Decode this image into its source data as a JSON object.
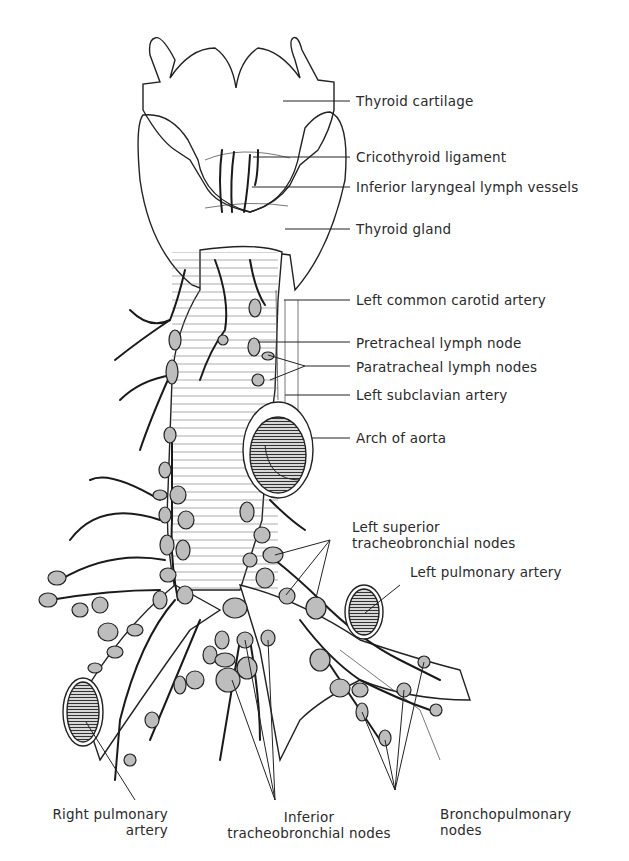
{
  "figure": {
    "labels_right": [
      {
        "id": "thyroid-cartilage",
        "text": "Thyroid cartilage",
        "y": 100
      },
      {
        "id": "cricothyroid-ligament",
        "text": "Cricothyroid ligament",
        "y": 157
      },
      {
        "id": "inferior-laryngeal-lymph-vessels",
        "text": "Inferior laryngeal lymph vessels",
        "y": 187
      },
      {
        "id": "thyroid-gland",
        "text": "Thyroid gland",
        "y": 229
      },
      {
        "id": "left-common-carotid-artery",
        "text": "Left common carotid artery",
        "y": 299
      },
      {
        "id": "pretracheal-lymph-node",
        "text": "Pretracheal lymph node",
        "y": 343
      },
      {
        "id": "paratracheal-lymph-nodes",
        "text": "Paratracheal lymph nodes",
        "y": 367
      },
      {
        "id": "left-subclavian-artery",
        "text": "Left subclavian artery",
        "y": 395
      },
      {
        "id": "arch-of-aorta",
        "text": "Arch of aorta",
        "y": 437
      }
    ],
    "label_left_superior": {
      "line1": "Left superior",
      "line2": "tracheobronchial nodes"
    },
    "label_left_pulmonary_artery": "Left pulmonary artery",
    "labels_bottom": {
      "right_pulmonary_artery": {
        "line1": "Right pulmonary",
        "line2": "artery"
      },
      "inferior_tracheobronchial_nodes": {
        "line1": "Inferior",
        "line2": "tracheobronchial nodes"
      },
      "bronchopulmonary_nodes": {
        "line1": "Bronchopulmonary",
        "line2": "nodes"
      }
    }
  }
}
